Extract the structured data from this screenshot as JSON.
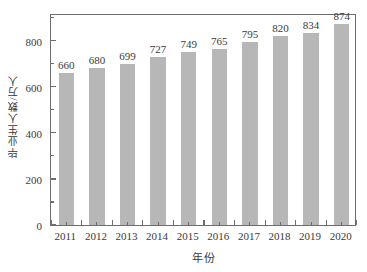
{
  "chart_data": {
    "type": "bar",
    "title": "",
    "subtitle": "",
    "xlabel": "年份",
    "ylabel": "毕业生人数/万人",
    "categories": [
      "2011",
      "2012",
      "2013",
      "2014",
      "2015",
      "2016",
      "2017",
      "2018",
      "2019",
      "2020"
    ],
    "values": [
      660,
      680,
      699,
      727,
      749,
      765,
      795,
      820,
      834,
      874
    ],
    "data_labels": [
      "660",
      "680",
      "699",
      "727",
      "749",
      "765",
      "795",
      "820",
      "834",
      "874"
    ],
    "ylim": [
      0,
      920
    ],
    "yticks": [
      0,
      200,
      400,
      600,
      800
    ],
    "ytick_labels": [
      "0",
      "200",
      "400",
      "600",
      "800"
    ],
    "yticks_minor": [
      100,
      300,
      500,
      700,
      900
    ],
    "grid": false,
    "legend": null,
    "bar_color": "#b7b7b7",
    "axis_color": "#6e6e6e",
    "text_color": "#3a3a3a",
    "background": "#ffffff"
  }
}
